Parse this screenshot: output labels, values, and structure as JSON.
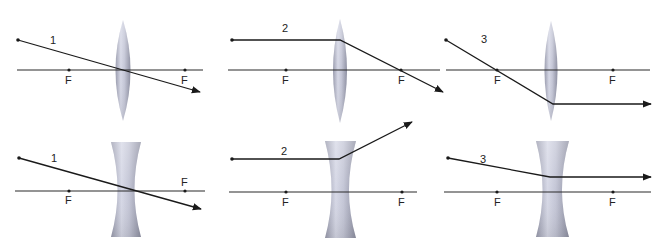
{
  "colors": {
    "ray": "#1a1a1a",
    "axis": "#2a2a2a",
    "lens_light": "#e4e6f2",
    "lens_mid": "#b8bacb",
    "lens_dark": "#8e90a2",
    "background": "#ffffff"
  },
  "panels": [
    {
      "id": "converging-1",
      "lens": "converging",
      "ray_label": "1",
      "focal_labels": [
        "F",
        "F"
      ],
      "description": "Ray through center passes undeviated"
    },
    {
      "id": "converging-2",
      "lens": "converging",
      "ray_label": "2",
      "focal_labels": [
        "F",
        "F"
      ],
      "description": "Parallel ray refracts through far focal point"
    },
    {
      "id": "converging-3",
      "lens": "converging",
      "ray_label": "3",
      "focal_labels": [
        "F",
        "F"
      ],
      "description": "Ray through near focal point exits parallel"
    },
    {
      "id": "diverging-1",
      "lens": "diverging",
      "ray_label": "1",
      "focal_labels": [
        "F",
        "F"
      ],
      "description": "Ray through center passes undeviated"
    },
    {
      "id": "diverging-2",
      "lens": "diverging",
      "ray_label": "2",
      "focal_labels": [
        "F",
        "F"
      ],
      "description": "Parallel ray diverges as if from near focal point"
    },
    {
      "id": "diverging-3",
      "lens": "diverging",
      "ray_label": "3",
      "focal_labels": [
        "F",
        "F"
      ],
      "description": "Ray aimed at far focal point exits parallel"
    }
  ]
}
